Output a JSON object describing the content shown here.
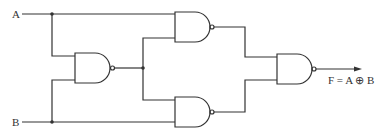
{
  "diagram": {
    "type": "logic-circuit",
    "inputs": [
      {
        "id": "A",
        "label": "A"
      },
      {
        "id": "B",
        "label": "B"
      }
    ],
    "gates": [
      {
        "id": "G1",
        "type": "NAND",
        "inputs": [
          "A",
          "B"
        ]
      },
      {
        "id": "G2",
        "type": "NAND",
        "inputs": [
          "A",
          "G1"
        ]
      },
      {
        "id": "G3",
        "type": "NAND",
        "inputs": [
          "G1",
          "B"
        ]
      },
      {
        "id": "G4",
        "type": "NAND",
        "inputs": [
          "G2",
          "G3"
        ]
      }
    ],
    "output": {
      "id": "F",
      "label": "F = A ⊕ B",
      "from": "G4"
    }
  },
  "labels": {
    "input_a": "A",
    "input_b": "B",
    "output": "F = A ⊕ B"
  },
  "colors": {
    "line": "#333333",
    "background": "#ffffff"
  }
}
